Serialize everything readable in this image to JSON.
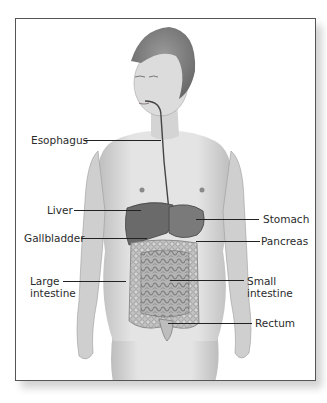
{
  "figure": {
    "type": "anatomical-diagram"
  },
  "labels": {
    "esophagus": "Esophagus",
    "liver": "Liver",
    "gallbladder": "Gallbladder",
    "large_intestine_1": "Large",
    "large_intestine_2": "intestine",
    "stomach": "Stomach",
    "pancreas": "Pancreas",
    "small_intestine_1": "Small",
    "small_intestine_2": "intestine",
    "rectum": "Rectum"
  },
  "colors": {
    "frame_border": "#555555",
    "leader_line": "#222222",
    "label_text": "#2b2b2b",
    "skin": "#d9d9d9",
    "organ_dark": "#6e6e6e",
    "intestine": "#b8b8b8"
  }
}
